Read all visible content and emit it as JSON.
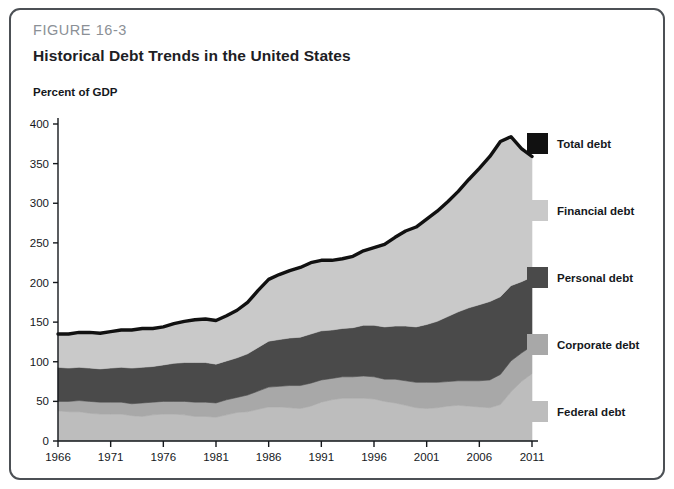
{
  "figure": {
    "label": "FIGURE 16-3",
    "title": "Historical Debt Trends in the United States",
    "unit_label": "Percent of GDP",
    "border_color": "#4c5055"
  },
  "legend": {
    "items": [
      {
        "label": "Total debt",
        "color": "#111111",
        "name": "legend-item-total-debt"
      },
      {
        "label": "Financial debt",
        "color": "#c9c9c9",
        "name": "legend-item-financial-debt"
      },
      {
        "label": "Personal debt",
        "color": "#4a4a4a",
        "name": "legend-item-personal-debt"
      },
      {
        "label": "Corporate debt",
        "color": "#a8a8a8",
        "name": "legend-item-corporate-debt"
      },
      {
        "label": "Federal debt",
        "color": "#bdbdbd",
        "name": "legend-item-federal-debt"
      }
    ]
  },
  "chart_data": {
    "type": "area",
    "stacked": true,
    "title": "Historical Debt Trends in the United States",
    "xlabel": "",
    "ylabel": "Percent of GDP",
    "xlim": [
      1966,
      2011
    ],
    "ylim": [
      0,
      400
    ],
    "ytick_step": 50,
    "yticks": [
      0,
      50,
      100,
      150,
      200,
      250,
      300,
      350,
      400
    ],
    "xticks": [
      1966,
      1971,
      1976,
      1981,
      1986,
      1991,
      1996,
      2001,
      2006,
      2011
    ],
    "grid": false,
    "legend_position": "right",
    "x": [
      1966,
      1967,
      1968,
      1969,
      1970,
      1971,
      1972,
      1973,
      1974,
      1975,
      1976,
      1977,
      1978,
      1979,
      1980,
      1981,
      1982,
      1983,
      1984,
      1985,
      1986,
      1987,
      1988,
      1989,
      1990,
      1991,
      1992,
      1993,
      1994,
      1995,
      1996,
      1997,
      1998,
      1999,
      2000,
      2001,
      2002,
      2003,
      2004,
      2005,
      2006,
      2007,
      2008,
      2009,
      2010,
      2011
    ],
    "series": [
      {
        "name": "Federal debt",
        "color": "#bdbdbd",
        "values": [
          38,
          37,
          37,
          35,
          34,
          34,
          34,
          32,
          31,
          33,
          34,
          34,
          33,
          31,
          31,
          30,
          33,
          36,
          37,
          40,
          43,
          43,
          42,
          41,
          44,
          49,
          52,
          54,
          54,
          54,
          53,
          50,
          48,
          45,
          42,
          41,
          42,
          44,
          45,
          44,
          43,
          42,
          46,
          62,
          75,
          85
        ]
      },
      {
        "name": "Corporate debt",
        "color": "#a8a8a8",
        "values": [
          12,
          13,
          14,
          15,
          15,
          15,
          15,
          15,
          17,
          16,
          16,
          16,
          17,
          18,
          18,
          18,
          19,
          19,
          21,
          23,
          25,
          26,
          28,
          29,
          29,
          28,
          27,
          27,
          27,
          28,
          28,
          28,
          30,
          31,
          32,
          33,
          32,
          31,
          31,
          32,
          33,
          35,
          38,
          39,
          36,
          35
        ]
      },
      {
        "name": "Personal debt",
        "color": "#4a4a4a",
        "values": [
          43,
          42,
          42,
          42,
          42,
          43,
          44,
          45,
          45,
          45,
          46,
          48,
          49,
          50,
          50,
          49,
          49,
          50,
          52,
          55,
          58,
          59,
          60,
          61,
          62,
          62,
          61,
          61,
          62,
          64,
          65,
          66,
          67,
          69,
          70,
          73,
          77,
          82,
          87,
          92,
          96,
          99,
          98,
          95,
          90,
          87
        ]
      },
      {
        "name": "Financial debt",
        "color": "#c9c9c9",
        "values": [
          42,
          43,
          44,
          45,
          45,
          46,
          47,
          48,
          49,
          48,
          48,
          50,
          52,
          54,
          55,
          55,
          57,
          60,
          65,
          72,
          78,
          82,
          85,
          88,
          90,
          89,
          88,
          88,
          90,
          94,
          98,
          104,
          112,
          120,
          126,
          133,
          139,
          145,
          152,
          162,
          172,
          183,
          196,
          188,
          168,
          152
        ]
      }
    ],
    "total_series": {
      "name": "Total debt",
      "color": "#111111",
      "description": "Sum of federal, corporate, personal and financial debt (outline of stacked area)",
      "values": [
        135,
        135,
        137,
        137,
        136,
        138,
        140,
        140,
        142,
        142,
        144,
        148,
        151,
        153,
        154,
        152,
        158,
        165,
        175,
        190,
        204,
        210,
        215,
        219,
        225,
        228,
        228,
        230,
        233,
        240,
        244,
        248,
        257,
        265,
        270,
        280,
        290,
        302,
        315,
        330,
        344,
        359,
        378,
        384,
        369,
        359
      ]
    }
  }
}
